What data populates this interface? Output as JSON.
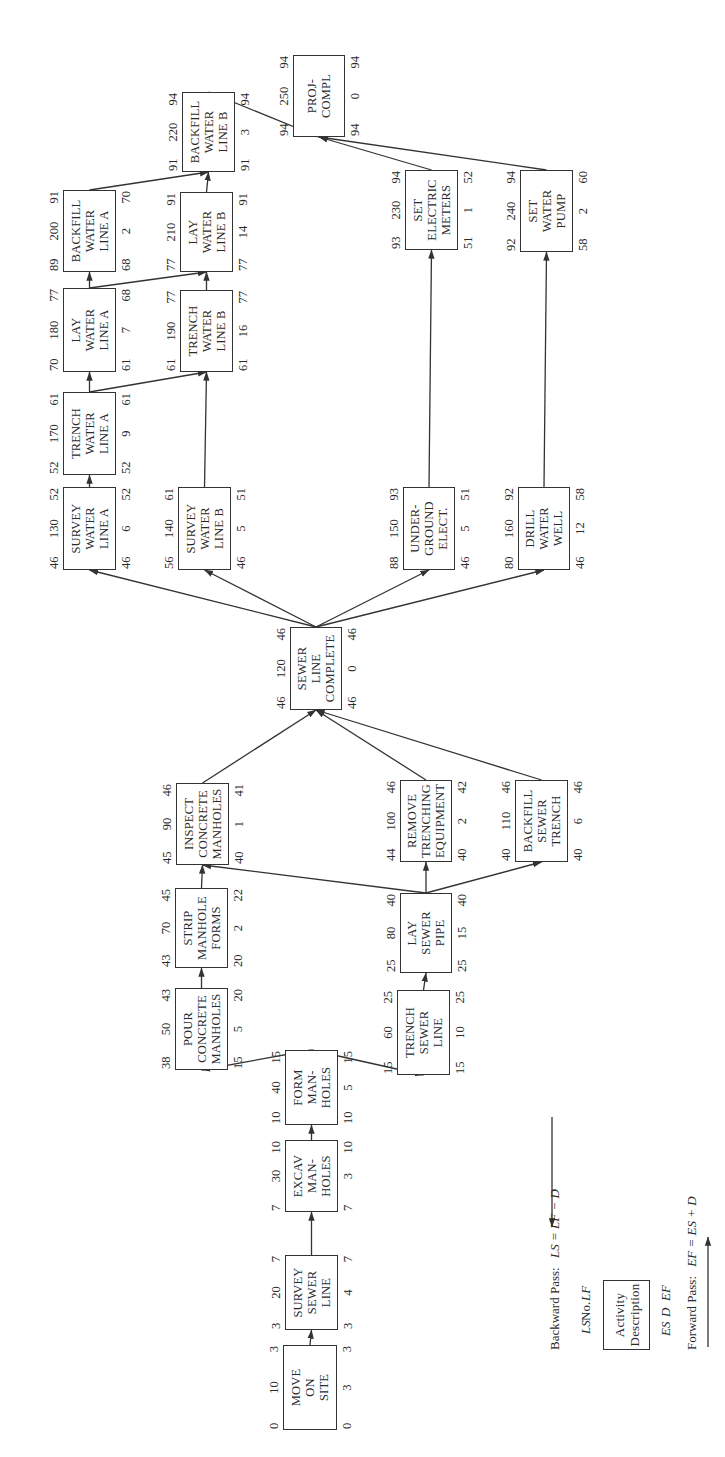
{
  "diagram": {
    "type": "precedence-network-cpm",
    "orientation": "rotated-90-ccw",
    "activities": [
      {
        "id": "move",
        "no": "10",
        "label": "MOVE\nON\nSITE",
        "ls": "0",
        "lf": "3",
        "es": "0",
        "d": "3",
        "ef": "3",
        "box": [
          27,
          283,
          85,
          54
        ]
      },
      {
        "id": "survey_sewer",
        "no": "20",
        "label": "SURVEY\nSEWER\nLINE",
        "ls": "3",
        "lf": "7",
        "es": "3",
        "d": "4",
        "ef": "7",
        "box": [
          127,
          285,
          75,
          53
        ]
      },
      {
        "id": "excav",
        "no": "30",
        "label": "EXCAV\nMAN-\nHOLES",
        "ls": "7",
        "lf": "10",
        "es": "7",
        "d": "3",
        "ef": "10",
        "box": [
          245,
          285,
          72,
          53
        ]
      },
      {
        "id": "form",
        "no": "40",
        "label": "FORM\nMAN-\nHOLES",
        "ls": "10",
        "lf": "15",
        "es": "10",
        "d": "5",
        "ef": "15",
        "box": [
          332,
          285,
          75,
          53
        ]
      },
      {
        "id": "pour",
        "no": "50",
        "label": "POUR\nCONCRETE\nMANHOLES",
        "ls": "38",
        "lf": "43",
        "es": "15",
        "d": "5",
        "ef": "20",
        "box": [
          387,
          175,
          82,
          53
        ]
      },
      {
        "id": "strip",
        "no": "70",
        "label": "STRIP\nMANHOLE\nFORMS",
        "ls": "43",
        "lf": "45",
        "es": "20",
        "d": "2",
        "ef": "22",
        "box": [
          489,
          175,
          80,
          53
        ]
      },
      {
        "id": "inspect",
        "no": "90",
        "label": "INSPECT\nCONCRETE\nMANHOLES",
        "ls": "45",
        "lf": "46",
        "es": "40",
        "d": "1",
        "ef": "41",
        "box": [
          592,
          176,
          82,
          53
        ]
      },
      {
        "id": "trench_sewer",
        "no": "60",
        "label": "TRENCH\nSEWER\nLINE",
        "ls": "15",
        "lf": "25",
        "es": "15",
        "d": "10",
        "ef": "25",
        "box": [
          382,
          397,
          85,
          53
        ]
      },
      {
        "id": "lay_sewer",
        "no": "80",
        "label": "LAY\nSEWER\nPIPE",
        "ls": "25",
        "lf": "40",
        "es": "25",
        "d": "15",
        "ef": "40",
        "box": [
          484,
          400,
          80,
          52
        ]
      },
      {
        "id": "remove",
        "no": "100",
        "label": "REMOVE\nTRENCHING\nEQUIPMENT",
        "ls": "44",
        "lf": "46",
        "es": "40",
        "d": "2",
        "ef": "42",
        "box": [
          595,
          400,
          82,
          52
        ]
      },
      {
        "id": "backfill_sewer",
        "no": "110",
        "label": "BACKFILL\nSEWER\nTRENCH",
        "ls": "40",
        "lf": "46",
        "es": "40",
        "d": "6",
        "ef": "46",
        "box": [
          595,
          515,
          82,
          53
        ]
      },
      {
        "id": "sewer_complete",
        "no": "120",
        "label": "SEWER\nLINE\nCOMPLETE",
        "ls": "46",
        "lf": "46",
        "es": "46",
        "d": "0",
        "ef": "46",
        "box": [
          747,
          290,
          83,
          52
        ]
      },
      {
        "id": "survey_a",
        "no": "130",
        "label": "SURVEY\nWATER\nLINE A",
        "ls": "46",
        "lf": "52",
        "es": "46",
        "d": "6",
        "ef": "52",
        "box": [
          887,
          63,
          83,
          53
        ]
      },
      {
        "id": "survey_b",
        "no": "140",
        "label": "SURVEY\nWATER\nLINE B",
        "ls": "56",
        "lf": "61",
        "es": "46",
        "d": "5",
        "ef": "51",
        "box": [
          887,
          178,
          83,
          53
        ]
      },
      {
        "id": "underground",
        "no": "150",
        "label": "UNDER-\nGROUND\nELECT.",
        "ls": "88",
        "lf": "93",
        "es": "46",
        "d": "5",
        "ef": "51",
        "box": [
          887,
          403,
          83,
          52
        ]
      },
      {
        "id": "drill",
        "no": "160",
        "label": "DRILL\nWATER\nWELL",
        "ls": "80",
        "lf": "92",
        "es": "46",
        "d": "12",
        "ef": "58",
        "box": [
          887,
          518,
          83,
          52
        ]
      },
      {
        "id": "trench_a",
        "no": "170",
        "label": "TRENCH\nWATER\nLINE A",
        "ls": "52",
        "lf": "61",
        "es": "52",
        "d": "9",
        "ef": "61",
        "box": [
          982,
          63,
          83,
          53
        ]
      },
      {
        "id": "lay_a",
        "no": "180",
        "label": "LAY\nWATER\nLINE A",
        "ls": "70",
        "lf": "77",
        "es": "61",
        "d": "7",
        "ef": "68",
        "box": [
          1085,
          63,
          84,
          53
        ]
      },
      {
        "id": "trench_b",
        "no": "190",
        "label": "TRENCH\nWATER\nLINE B",
        "ls": "61",
        "lf": "77",
        "es": "61",
        "d": "16",
        "ef": "77",
        "box": [
          1085,
          180,
          82,
          53
        ]
      },
      {
        "id": "backfill_a",
        "no": "200",
        "label": "BACKFILL\nWATER\nLINE A",
        "ls": "89",
        "lf": "91",
        "es": "68",
        "d": "2",
        "ef": "70",
        "box": [
          1185,
          63,
          82,
          53
        ]
      },
      {
        "id": "lay_b",
        "no": "210",
        "label": "LAY\nWATER\nLINE B",
        "ls": "77",
        "lf": "91",
        "es": "77",
        "d": "14",
        "ef": "91",
        "box": [
          1185,
          180,
          80,
          53
        ]
      },
      {
        "id": "backfill_b",
        "no": "220",
        "label": "BACKFILL\nWATER\nLINE B",
        "ls": "91",
        "lf": "94",
        "es": "91",
        "d": "3",
        "ef": "94",
        "box": [
          1285,
          182,
          80,
          53
        ]
      },
      {
        "id": "meters",
        "no": "230",
        "label": "SET\nELECTRIC\nMETERS",
        "ls": "93",
        "lf": "94",
        "es": "51",
        "d": "1",
        "ef": "52",
        "box": [
          1207,
          405,
          80,
          53
        ]
      },
      {
        "id": "pump",
        "no": "240",
        "label": "SET\nWATER\nPUMP",
        "ls": "92",
        "lf": "94",
        "es": "58",
        "d": "2",
        "ef": "60",
        "box": [
          1205,
          520,
          82,
          53
        ]
      },
      {
        "id": "proj",
        "no": "250",
        "label": "PROJ-\nCOMPL",
        "ls": "94",
        "lf": "94",
        "es": "94",
        "d": "0",
        "ef": "94",
        "box": [
          1320,
          293,
          82,
          52
        ]
      }
    ],
    "edges": [
      [
        "move",
        "survey_sewer"
      ],
      [
        "survey_sewer",
        "excav"
      ],
      [
        "excav",
        "form"
      ],
      [
        "form",
        "pour"
      ],
      [
        "form",
        "trench_sewer"
      ],
      [
        "pour",
        "strip"
      ],
      [
        "strip",
        "inspect"
      ],
      [
        "trench_sewer",
        "lay_sewer"
      ],
      [
        "lay_sewer",
        "inspect"
      ],
      [
        "lay_sewer",
        "remove"
      ],
      [
        "lay_sewer",
        "backfill_sewer"
      ],
      [
        "inspect",
        "sewer_complete"
      ],
      [
        "remove",
        "sewer_complete"
      ],
      [
        "backfill_sewer",
        "sewer_complete"
      ],
      [
        "sewer_complete",
        "survey_a"
      ],
      [
        "sewer_complete",
        "survey_b"
      ],
      [
        "sewer_complete",
        "underground"
      ],
      [
        "sewer_complete",
        "drill"
      ],
      [
        "survey_a",
        "trench_a"
      ],
      [
        "survey_b",
        "trench_b"
      ],
      [
        "trench_a",
        "lay_a"
      ],
      [
        "trench_a",
        "trench_b"
      ],
      [
        "lay_a",
        "backfill_a"
      ],
      [
        "lay_a",
        "lay_b"
      ],
      [
        "trench_b",
        "lay_b"
      ],
      [
        "backfill_a",
        "backfill_b"
      ],
      [
        "lay_b",
        "backfill_b"
      ],
      [
        "backfill_b",
        "proj"
      ],
      [
        "underground",
        "meters"
      ],
      [
        "drill",
        "pump"
      ],
      [
        "meters",
        "proj"
      ],
      [
        "pump",
        "proj"
      ]
    ]
  },
  "legend": {
    "backward_pass_label": "Backward Pass:",
    "backward_pass_formula": "LS = LF − D",
    "forward_pass_label": "Forward Pass:",
    "forward_pass_formula": "EF = ES + D",
    "top_row": [
      "LS",
      "No.",
      "LF"
    ],
    "box_text": "Activity\nDescription",
    "bottom_row": [
      "ES",
      "D",
      "EF"
    ]
  },
  "colors": {
    "line": "#333333",
    "text": "#2a2a2a",
    "background": "#ffffff"
  }
}
